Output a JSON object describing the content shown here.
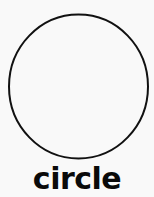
{
  "card": {
    "label": "circle",
    "shape": "circle-icon",
    "colors": {
      "background": "#f9f9f9",
      "stroke": "#111111",
      "text": "#0a0a0a"
    }
  }
}
